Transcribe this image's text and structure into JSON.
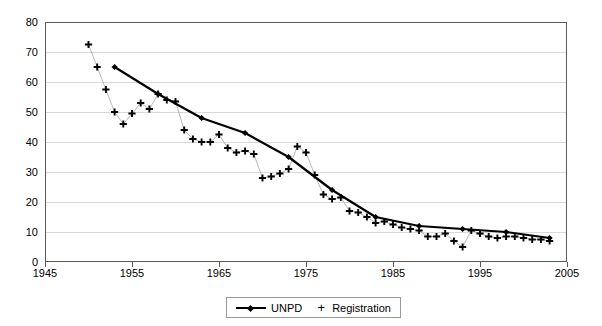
{
  "chart_data": {
    "type": "line",
    "title": "",
    "xlabel": "",
    "ylabel": "",
    "xlim": [
      1945,
      2005
    ],
    "ylim": [
      0,
      80
    ],
    "xticks": [
      1945,
      1955,
      1965,
      1975,
      1985,
      1995,
      2005
    ],
    "yticks": [
      0,
      10,
      20,
      30,
      40,
      50,
      60,
      70,
      80
    ],
    "grid": "horizontal",
    "legend_position": "bottom-center",
    "series": [
      {
        "name": "UNPD",
        "marker": "diamond",
        "style": "line-with-markers",
        "color": "#000000",
        "x": [
          1953,
          1958,
          1963,
          1968,
          1973,
          1978,
          1983,
          1988,
          1993,
          1998,
          2003
        ],
        "values": [
          65,
          56,
          48,
          43,
          35,
          24,
          15,
          12,
          11,
          10,
          8
        ]
      },
      {
        "name": "Registration",
        "marker": "plus",
        "style": "markers-with-thin-line",
        "color": "#000000",
        "x": [
          1950,
          1951,
          1952,
          1953,
          1954,
          1955,
          1956,
          1957,
          1958,
          1959,
          1960,
          1961,
          1962,
          1963,
          1964,
          1965,
          1966,
          1967,
          1968,
          1969,
          1970,
          1971,
          1972,
          1973,
          1974,
          1975,
          1976,
          1977,
          1978,
          1979,
          1980,
          1981,
          1982,
          1983,
          1984,
          1985,
          1986,
          1987,
          1988,
          1989,
          1990,
          1991,
          1992,
          1993,
          1994,
          1995,
          1996,
          1997,
          1998,
          1999,
          2000,
          2001,
          2002,
          2003
        ],
        "values": [
          72.5,
          65,
          57.5,
          50,
          46,
          49.5,
          53,
          51,
          56,
          54,
          53.5,
          44,
          41,
          40,
          40,
          42.5,
          38,
          36.5,
          37,
          36,
          28,
          28.5,
          29.5,
          31,
          38.5,
          36.5,
          29,
          22.5,
          21,
          21.5,
          17,
          16.5,
          15,
          13,
          13.5,
          12.5,
          11.5,
          11,
          10.5,
          8.5,
          8.5,
          9.5,
          7,
          5,
          10.5,
          9.5,
          8.5,
          8,
          8.5,
          8.5,
          8,
          7.5,
          7.5,
          7
        ]
      }
    ]
  },
  "legend": {
    "unpd_label": "UNPD",
    "registration_label": "Registration"
  }
}
